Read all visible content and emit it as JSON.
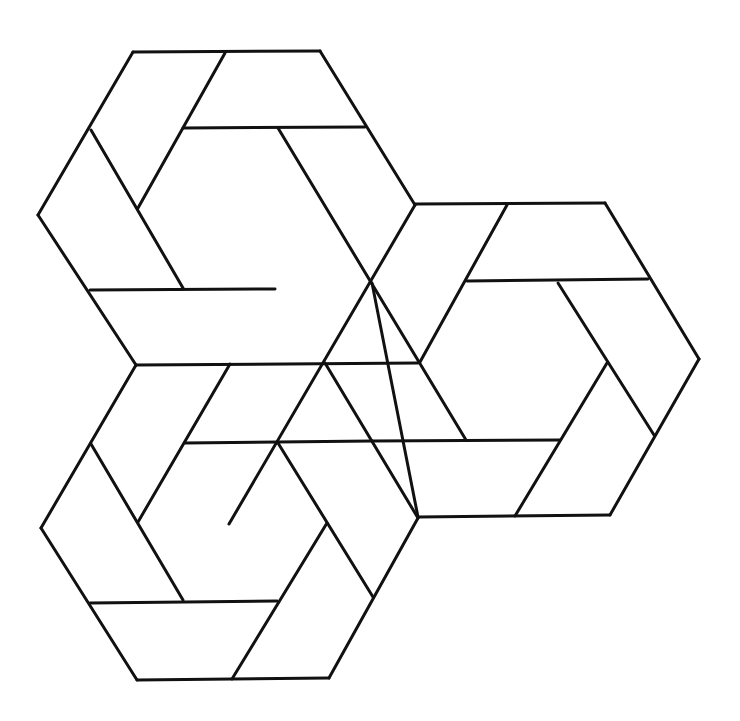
{
  "figure": {
    "stroke_color": "#111111",
    "background": "#ffffff",
    "hexagons": [
      {
        "name": "top-left",
        "segments": [
          [
            133,
            52,
            320,
            51
          ],
          [
            320,
            51,
            415,
            205
          ],
          [
            133,
            52,
            38,
            215
          ],
          [
            38,
            215,
            136,
            365
          ],
          [
            225,
            53,
            183,
            128
          ],
          [
            183,
            128,
            365,
            127
          ],
          [
            91,
            130,
            183,
            288
          ],
          [
            183,
            128,
            138,
            208
          ],
          [
            90,
            290,
            275,
            289
          ],
          [
            278,
            128,
            370,
            283
          ],
          [
            38,
            215,
            38,
            215
          ]
        ]
      }
    ],
    "lines": [
      [
        133,
        52,
        320,
        51
      ],
      [
        320,
        51,
        415,
        205
      ],
      [
        133,
        52,
        38,
        215
      ],
      [
        38,
        215,
        136,
        365
      ],
      [
        225,
        53,
        138,
        208
      ],
      [
        183,
        128,
        365,
        127
      ],
      [
        91,
        130,
        183,
        288
      ],
      [
        90,
        290,
        275,
        289
      ],
      [
        278,
        128,
        466,
        440
      ],
      [
        415,
        205,
        229,
        524
      ],
      [
        136,
        365,
        418,
        363
      ],
      [
        415,
        204,
        605,
        203
      ],
      [
        605,
        203,
        699,
        359
      ],
      [
        699,
        359,
        610,
        515
      ],
      [
        418,
        517,
        610,
        515
      ],
      [
        507,
        205,
        420,
        362
      ],
      [
        467,
        281,
        648,
        279
      ],
      [
        558,
        283,
        654,
        435
      ],
      [
        607,
        363,
        515,
        516
      ],
      [
        372,
        441,
        560,
        440
      ],
      [
        372,
        283,
        418,
        517
      ],
      [
        136,
        365,
        41,
        528
      ],
      [
        41,
        528,
        137,
        680
      ],
      [
        137,
        680,
        329,
        678
      ],
      [
        329,
        678,
        418,
        518
      ],
      [
        230,
        364,
        138,
        522
      ],
      [
        185,
        443,
        372,
        441
      ],
      [
        91,
        444,
        183,
        600
      ],
      [
        90,
        603,
        277,
        601
      ],
      [
        327,
        523,
        232,
        679
      ],
      [
        278,
        443,
        373,
        597
      ],
      [
        325,
        363,
        418,
        518
      ]
    ]
  }
}
